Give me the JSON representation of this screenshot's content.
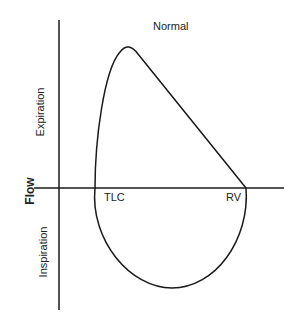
{
  "title": "Normal",
  "axis": {
    "y_label": "Flow",
    "upper_label": "Expiration",
    "lower_label": "Inspiration"
  },
  "points": {
    "tlc": "TLC",
    "rv": "RV"
  },
  "colors": {
    "line": "#1a1a1a",
    "background": "#ffffff"
  }
}
